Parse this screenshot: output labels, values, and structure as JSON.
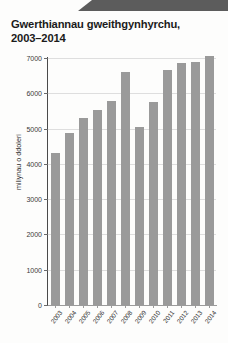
{
  "chart_data": {
    "type": "bar",
    "title": "Gwerthiannau gweithgynhyrchu,",
    "title_line2": "2003–2014",
    "xlabel": "",
    "ylabel": "miliynau o ddoleri",
    "categories": [
      "2003",
      "2004",
      "2005",
      "2006",
      "2007",
      "2008",
      "2009",
      "2010",
      "2011",
      "2012",
      "2013",
      "2014"
    ],
    "values": [
      4300,
      4880,
      5300,
      5530,
      5780,
      6600,
      5050,
      5750,
      6650,
      6860,
      6880,
      7050
    ],
    "ylim": [
      0,
      7000
    ],
    "ytick_values": [
      0,
      1000,
      2000,
      3000,
      4000,
      5000,
      6000,
      7000
    ],
    "ytick_labels": [
      "0",
      "1000",
      "2000",
      "3000",
      "4000",
      "5000",
      "6000",
      "7000"
    ],
    "grid": true,
    "legend": null,
    "bar_color": "#9a9a9a",
    "grid_color": "#dedede",
    "axis_color": "#4a4a4a"
  }
}
